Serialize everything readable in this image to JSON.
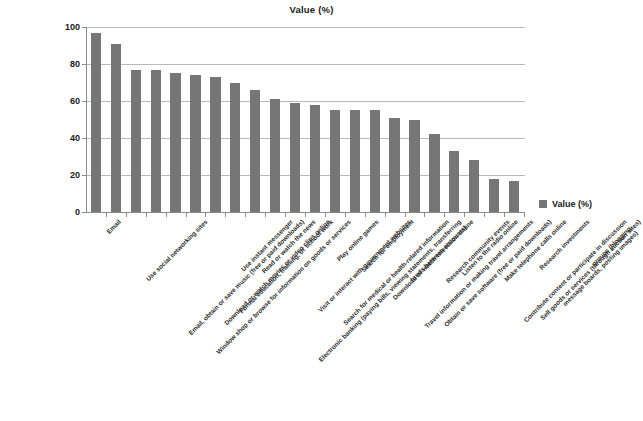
{
  "chart_data": {
    "type": "bar",
    "title": "Value (%)",
    "xlabel": "",
    "ylabel": "",
    "ylim": [
      0,
      100
    ],
    "yticks": [
      0,
      20,
      40,
      60,
      80,
      100
    ],
    "grid": true,
    "legend_position": "right",
    "series_name": "Value (%)",
    "bar_color": "#767676",
    "categories": [
      "Email",
      "Use social networking sites",
      "Email, obtain or save music (free or paid downloads)",
      "Window shop or browse for information on goods or services",
      "Download or watch movies or video clips online",
      "Formal education, training, or school work",
      "Use instant messenger",
      "Read or watch the news",
      "Electronic banking (paying bills, viewing statements, transferring\nfunds between accounts)",
      "Visit or interact with government websites",
      "Search for medical or health-related information",
      "Play online games",
      "Search for employment",
      "Download or watch television online",
      "Travel information or making travel arrangements",
      "Obtain or save software (free or paid downloads)",
      "Research community events",
      "Listen to the radio online",
      "Contribute content or participate in discussion groups (blogging,\nmessage boards, posting images)",
      "Make telephone calls online",
      "Sell goods or services (through auction sites)",
      "Research investments"
    ],
    "values": [
      97,
      91,
      77,
      77,
      75,
      74,
      73,
      70,
      66,
      61,
      59,
      58,
      55,
      55,
      55,
      51,
      50,
      42,
      33,
      28,
      18,
      17
    ]
  },
  "legend": {
    "label": "Value (%)"
  }
}
